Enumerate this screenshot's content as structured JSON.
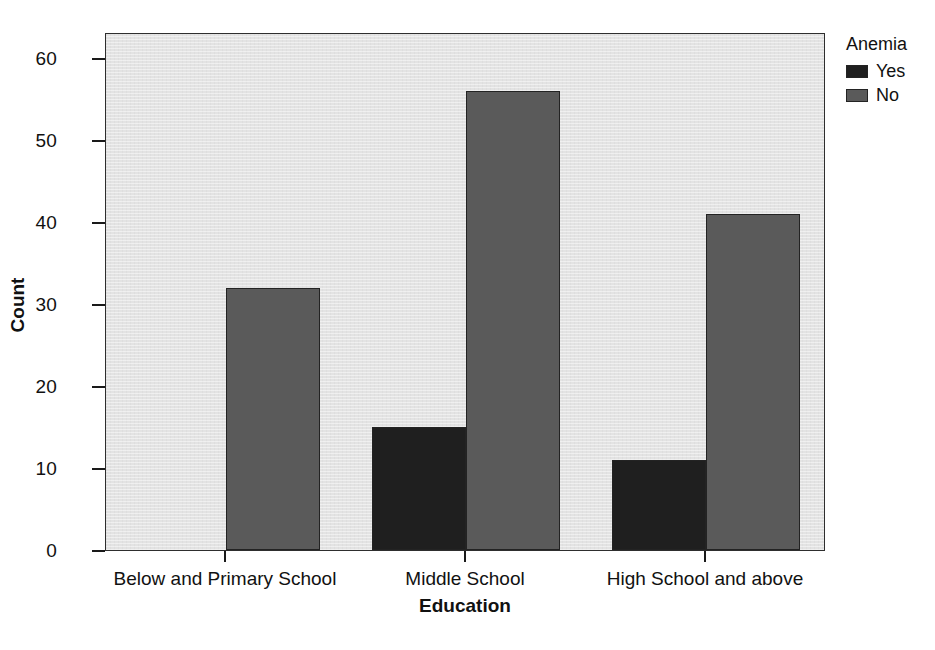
{
  "chart_data": {
    "type": "bar",
    "title": "",
    "xlabel": "Education",
    "ylabel": "Count",
    "categories": [
      "Below and Primary School",
      "Middle School",
      "High School and above"
    ],
    "series": [
      {
        "name": "Yes",
        "values": [
          0,
          15,
          11
        ],
        "color": "#1f1f1f"
      },
      {
        "name": "No",
        "values": [
          32,
          56,
          41
        ],
        "color": "#5a5a5a"
      }
    ],
    "ylim": [
      0,
      63.2
    ],
    "yticks": [
      0,
      10,
      20,
      30,
      40,
      50,
      60
    ],
    "ytick_labels": [
      "0",
      "10",
      "20",
      "30",
      "40",
      "50",
      "60"
    ],
    "grid": false,
    "legend": {
      "title": "Anemia",
      "position": "right",
      "entries": [
        {
          "label": "Yes",
          "color": "#1f1f1f"
        },
        {
          "label": "No",
          "color": "#5a5a5a"
        }
      ]
    },
    "plot_background": "#e3e3e3",
    "axis_color": "#1a1a1a",
    "bar_edge_color": "#232323"
  }
}
